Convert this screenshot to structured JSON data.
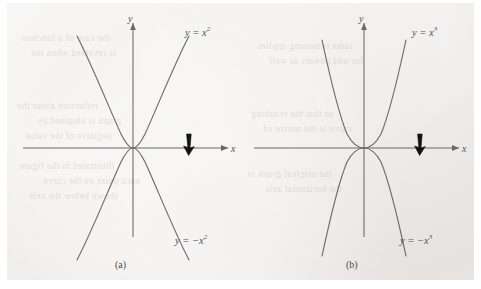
{
  "figure": {
    "kind": "textbook-figure-scan",
    "background_color": "#eceae8",
    "page_margin_color": "#ffffff",
    "ink_color": "#55504b",
    "marker_color": "#111111",
    "panel_count": 2
  },
  "panels": [
    {
      "id": "a",
      "caption": "(a)",
      "axis_x_label": "x",
      "axis_y_label": "y",
      "upper_curve_label_base": "y = x",
      "upper_curve_label_exp": "2",
      "lower_curve_label_base": "y = −x",
      "lower_curve_label_exp": "2",
      "marker": "down-arrow"
    },
    {
      "id": "b",
      "caption": "(b)",
      "axis_x_label": "x",
      "axis_y_label": "y",
      "upper_curve_label_base": "y = x",
      "upper_curve_label_exp": "3",
      "lower_curve_label_base": "y = −x",
      "lower_curve_label_exp": "3",
      "marker": "down-arrow"
    }
  ],
  "bleed_text": [
    {
      "left": 14,
      "top": 28,
      "text": "the case of a function"
    },
    {
      "left": 24,
      "top": 43,
      "text": "is reversed when the"
    },
    {
      "left": 10,
      "top": 96,
      "text": "reflection about the"
    },
    {
      "left": 30,
      "top": 111,
      "text": "graph is obtained by"
    },
    {
      "left": 18,
      "top": 126,
      "text": "negative of the value"
    },
    {
      "left": 12,
      "top": 156,
      "text": "illustrated in the figure"
    },
    {
      "left": 36,
      "top": 171,
      "text": "each point on the curve"
    },
    {
      "left": 22,
      "top": 186,
      "text": "shown below the axis"
    },
    {
      "left": 250,
      "top": 36,
      "text": "same reasoning applies"
    },
    {
      "left": 262,
      "top": 51,
      "text": "for odd powers as well"
    },
    {
      "left": 244,
      "top": 104,
      "text": "so that the resulting"
    },
    {
      "left": 256,
      "top": 119,
      "text": "curve is the mirror of"
    },
    {
      "left": 240,
      "top": 164,
      "text": "the original graph in"
    },
    {
      "left": 258,
      "top": 179,
      "text": "the horizontal axis"
    }
  ],
  "chart_data": [
    {
      "type": "line",
      "panel": "a",
      "title": "(a)",
      "xlabel": "x",
      "ylabel": "y",
      "xlim": [
        -2.3,
        2.3
      ],
      "ylim": [
        -4.6,
        4.6
      ],
      "grid": false,
      "legend": "inline-curve-labels",
      "series": [
        {
          "name": "y = x^2",
          "label": "y = x²",
          "x": [
            -2.1,
            -1.8,
            -1.5,
            -1.2,
            -0.9,
            -0.6,
            -0.3,
            0,
            0.3,
            0.6,
            0.9,
            1.2,
            1.5,
            1.8,
            2.1
          ],
          "y": [
            4.41,
            3.24,
            2.25,
            1.44,
            0.81,
            0.36,
            0.09,
            0,
            0.09,
            0.36,
            0.81,
            1.44,
            2.25,
            3.24,
            4.41
          ]
        },
        {
          "name": "y = -x^2",
          "label": "y = −x²",
          "x": [
            -2.1,
            -1.8,
            -1.5,
            -1.2,
            -0.9,
            -0.6,
            -0.3,
            0,
            0.3,
            0.6,
            0.9,
            1.2,
            1.5,
            1.8,
            2.1
          ],
          "y": [
            -4.41,
            -3.24,
            -2.25,
            -1.44,
            -0.81,
            -0.36,
            -0.09,
            0,
            -0.09,
            -0.36,
            -0.81,
            -1.44,
            -2.25,
            -3.24,
            -4.41
          ]
        }
      ],
      "annotations": [
        {
          "type": "down-arrow-marker",
          "x": 1.25,
          "y": 0
        }
      ]
    },
    {
      "type": "line",
      "panel": "b",
      "title": "(b)",
      "xlabel": "x",
      "ylabel": "y",
      "xlim": [
        -2.3,
        2.3
      ],
      "ylim": [
        -4.6,
        4.6
      ],
      "grid": false,
      "legend": "inline-curve-labels",
      "series": [
        {
          "name": "y = x^3",
          "label": "y = x³",
          "x": [
            -1.7,
            -1.5,
            -1.3,
            -1.1,
            -0.9,
            -0.7,
            -0.5,
            -0.3,
            0,
            0.3,
            0.5,
            0.7,
            0.9,
            1.1,
            1.3,
            1.5,
            1.7
          ],
          "y": [
            4.35,
            2.93,
            1.88,
            1.13,
            0.62,
            0.29,
            0.11,
            0.02,
            0,
            0.02,
            0.11,
            0.29,
            0.62,
            1.13,
            1.88,
            2.93,
            4.35
          ]
        },
        {
          "name": "y = -x^3",
          "label": "y = −x³",
          "x": [
            -1.7,
            -1.5,
            -1.3,
            -1.1,
            -0.9,
            -0.7,
            -0.5,
            -0.3,
            0,
            0.3,
            0.5,
            0.7,
            0.9,
            1.1,
            1.3,
            1.5,
            1.7
          ],
          "y": [
            -4.35,
            -2.93,
            -1.88,
            -1.13,
            -0.62,
            -0.29,
            -0.11,
            -0.02,
            0,
            -0.02,
            -0.11,
            -0.29,
            -0.62,
            -1.13,
            -1.88,
            -2.93,
            -4.35
          ]
        }
      ],
      "annotations": [
        {
          "type": "down-arrow-marker",
          "x": 1.25,
          "y": 0
        }
      ]
    }
  ]
}
